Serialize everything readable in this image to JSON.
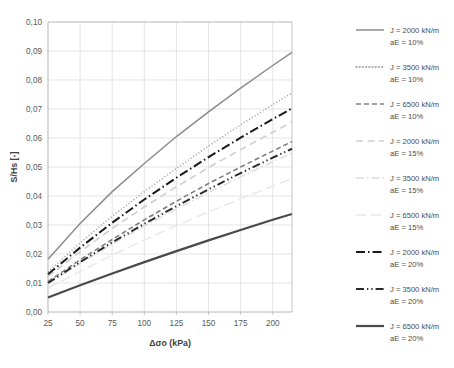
{
  "chart_data": {
    "type": "line",
    "title": "",
    "xlabel": "Δσo (kPa)",
    "ylabel": "S/Hs [-]",
    "xlim": [
      25,
      215
    ],
    "ylim": [
      0,
      0.1
    ],
    "xticks": [
      25,
      50,
      75,
      100,
      125,
      150,
      175,
      200
    ],
    "xtick_labels": [
      "25",
      "50",
      "75",
      "100",
      "125",
      "150",
      "175",
      "200"
    ],
    "yticks": [
      0,
      0.01,
      0.02,
      0.03,
      0.04,
      0.05,
      0.06,
      0.07,
      0.08,
      0.09,
      0.1
    ],
    "ytick_labels": [
      "0,00",
      "0,01",
      "0,02",
      "0,03",
      "0,04",
      "0,05",
      "0,06",
      "0,07",
      "0,08",
      "0,09",
      "0,10"
    ],
    "grid": true,
    "legend_position": "right",
    "x": [
      25,
      50,
      75,
      100,
      125,
      150,
      175,
      200,
      215
    ],
    "series": [
      {
        "name": "J = 2000 kN/m aE = 10%",
        "label_line1": "J = 2000 kN/m",
        "label_line2": "aE = 10%",
        "color": "#8c8c8c",
        "width": 1.5,
        "dash": "none",
        "values": [
          0.0182,
          0.0305,
          0.0415,
          0.0512,
          0.0605,
          0.069,
          0.0772,
          0.085,
          0.0895
        ]
      },
      {
        "name": "J = 3500 kN/m aE = 10%",
        "label_line1": "J = 3500 kN/m",
        "label_line2": "aE = 10%",
        "color": "#9a9a9a",
        "width": 1.5,
        "dash": "dotted",
        "values": [
          0.0138,
          0.0238,
          0.033,
          0.0415,
          0.0495,
          0.0572,
          0.0645,
          0.0715,
          0.0755
        ]
      },
      {
        "name": "J = 6500 kN/m aE = 10%",
        "label_line1": "J = 6500 kN/m",
        "label_line2": "aE = 10%",
        "color": "#7d7d7d",
        "width": 1.5,
        "dash": "dashed",
        "values": [
          0.0105,
          0.018,
          0.025,
          0.0318,
          0.0382,
          0.0443,
          0.05,
          0.0555,
          0.0588
        ]
      },
      {
        "name": "J = 2000 kN/m aE = 15%",
        "label_line1": "J = 2000 kN/m",
        "label_line2": "aE = 15%",
        "color": "#cfcfcf",
        "width": 1.6,
        "dash": "dashed-wide",
        "values": [
          0.0122,
          0.0208,
          0.0288,
          0.0362,
          0.0432,
          0.0498,
          0.056,
          0.062,
          0.0655
        ]
      },
      {
        "name": "J = 3500 kN/m aE = 15%",
        "label_line1": "J = 3500 kN/m",
        "label_line2": "aE = 15%",
        "color": "#dcdcdc",
        "width": 1.5,
        "dash": "dash-dot",
        "values": [
          0.0098,
          0.0168,
          0.0234,
          0.0296,
          0.0355,
          0.0412,
          0.0466,
          0.0518,
          0.0548
        ]
      },
      {
        "name": "J = 6500 kN/m aE = 15%",
        "label_line1": "J = 6500 kN/m",
        "label_line2": "aE = 15%",
        "color": "#e8e8e8",
        "width": 1.5,
        "dash": "longdash",
        "values": [
          0.0082,
          0.014,
          0.0196,
          0.0248,
          0.0298,
          0.0345,
          0.039,
          0.0434,
          0.046
        ]
      },
      {
        "name": "J = 2000 kN/m aE = 20%",
        "label_line1": "J = 2000 kN/m",
        "label_line2": "aE = 20%",
        "color": "#1a1a1a",
        "width": 2.0,
        "dash": "dash-dot-thick",
        "values": [
          0.013,
          0.0222,
          0.0308,
          0.0388,
          0.0463,
          0.0534,
          0.0601,
          0.0665,
          0.0702
        ]
      },
      {
        "name": "J = 3500 kN/m aE = 20%",
        "label_line1": "J = 3500 kN/m",
        "label_line2": "aE = 20%",
        "color": "#2b2b2b",
        "width": 2.0,
        "dash": "dash-dot-dot-thick",
        "values": [
          0.01,
          0.0172,
          0.024,
          0.0304,
          0.0365,
          0.0423,
          0.0479,
          0.0532,
          0.0563
        ]
      },
      {
        "name": "J = 6500 kN/m aE = 20%",
        "label_line1": "J = 6500 kN/m",
        "label_line2": "aE = 20%",
        "color": "#4a4a4a",
        "width": 2.2,
        "dash": "none",
        "values": [
          0.005,
          0.0092,
          0.0133,
          0.0172,
          0.021,
          0.0247,
          0.0283,
          0.0318,
          0.0338
        ]
      }
    ]
  }
}
